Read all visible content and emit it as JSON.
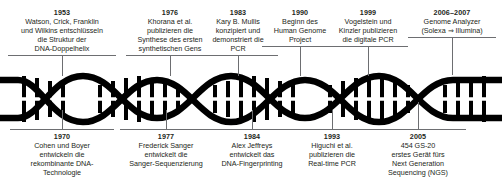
{
  "figure": {
    "kind": "dna-double-helix-timeline",
    "title": "",
    "line_color": "#6d6e71",
    "helix_color": "#000000",
    "background": "#ffffff"
  },
  "events_top": [
    {
      "year": "1953",
      "lines": [
        "Watson, Crick, Franklin",
        "und Wilkins entschlüsseln",
        "die Struktur der",
        "DNA-Doppelhelix"
      ]
    },
    {
      "year": "1976",
      "lines": [
        "Khorana et al.",
        "publizieren die",
        "Synthese des ersten",
        "synthetischen Gens"
      ]
    },
    {
      "year": "1983",
      "lines": [
        "Kary B. Mullis",
        "konzipiert und",
        "demonstriert die",
        "PCR"
      ]
    },
    {
      "year": "1990",
      "lines": [
        "Beginn des",
        "Human Genome",
        "Project"
      ]
    },
    {
      "year": "1999",
      "lines": [
        "Vogelstein und",
        "Kinzler publizieren",
        "die digitale PCR"
      ]
    },
    {
      "year": "2006–2007",
      "lines": [
        "Genome Analyzer",
        "(Solexa ⇒ Illumina)"
      ]
    }
  ],
  "events_bottom": [
    {
      "year": "1970",
      "lines": [
        "Cohen und Boyer",
        "entwickeln die",
        "rekombinante DNA-",
        "Technologie"
      ]
    },
    {
      "year": "1977",
      "lines": [
        "Frederick Sanger",
        "entwickelt die",
        "Sanger-Sequenzierung"
      ]
    },
    {
      "year": "1984",
      "lines": [
        "Alex Jeffreys",
        "entwickelt das",
        "DNA-Fingerprinting"
      ]
    },
    {
      "year": "1993",
      "lines": [
        "Higuchi et al.",
        "publizieren die",
        "Real-time PCR"
      ]
    },
    {
      "year": "2005",
      "lines": [
        "454 GS-20",
        "erstes Gerät fürs",
        "Next Generation",
        "Sequencing (NGS)"
      ]
    }
  ]
}
